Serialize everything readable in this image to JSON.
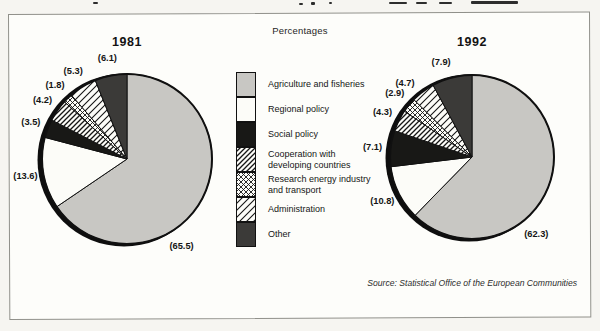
{
  "page": {
    "percentages_label": "Percentages",
    "source_note": "Source: Statistical Office of the European Communities"
  },
  "fills": {
    "agriculture": {
      "type": "solid",
      "color": "#c8c7c3"
    },
    "regional": {
      "type": "solid",
      "color": "#fcfcf8"
    },
    "social": {
      "type": "solid",
      "color": "#181816"
    },
    "cooperation": {
      "type": "pattern",
      "pattern": "diagonal-hatch-dense"
    },
    "research": {
      "type": "pattern",
      "pattern": "crosshatch"
    },
    "administration": {
      "type": "pattern",
      "pattern": "diagonal-hatch-wide"
    },
    "other": {
      "type": "solid",
      "color": "#3b3a38"
    }
  },
  "legend": {
    "items": [
      {
        "label": "Agriculture and fisheries",
        "fill": "agriculture"
      },
      {
        "label": "Regional policy",
        "fill": "regional"
      },
      {
        "label": "Social policy",
        "fill": "social"
      },
      {
        "label": "Cooperation with developing countries",
        "fill": "cooperation"
      },
      {
        "label": "Research energy industry and transport",
        "fill": "research"
      },
      {
        "label": "Administration",
        "fill": "administration"
      },
      {
        "label": "Other",
        "fill": "other"
      }
    ]
  },
  "chart_data": [
    {
      "type": "pie",
      "title": "1981",
      "categories": [
        "Agriculture and fisheries",
        "Regional policy",
        "Social policy",
        "Cooperation with developing countries",
        "Research energy industry and transport",
        "Administration",
        "Other"
      ],
      "values": [
        65.5,
        13.6,
        3.5,
        4.2,
        1.8,
        5.3,
        6.1
      ],
      "fills": [
        "agriculture",
        "regional",
        "social",
        "cooperation",
        "research",
        "administration",
        "other"
      ],
      "start_angle_deg": 0,
      "direction": "clockwise",
      "label_format": "parenthesized",
      "label_angle_overrides": {
        "0": 148
      },
      "layout": {
        "cx": 127,
        "cy": 159,
        "r": 85,
        "label_r": 103,
        "title_top": 35
      }
    },
    {
      "type": "pie",
      "title": "1992",
      "categories": [
        "Agriculture and fisheries",
        "Regional policy",
        "Social policy",
        "Cooperation with developing countries",
        "Research energy industry and transport",
        "Administration",
        "Other"
      ],
      "values": [
        62.3,
        10.8,
        7.1,
        4.3,
        2.9,
        4.7,
        7.9
      ],
      "fills": [
        "agriculture",
        "regional",
        "social",
        "cooperation",
        "research",
        "administration",
        "other"
      ],
      "start_angle_deg": 0,
      "direction": "clockwise",
      "label_format": "parenthesized",
      "label_angle_overrides": {
        "0": 140,
        "5": 318,
        "6": 342
      },
      "layout": {
        "cx": 472,
        "cy": 157,
        "r": 82,
        "label_r": 100,
        "title_top": 35
      }
    }
  ]
}
